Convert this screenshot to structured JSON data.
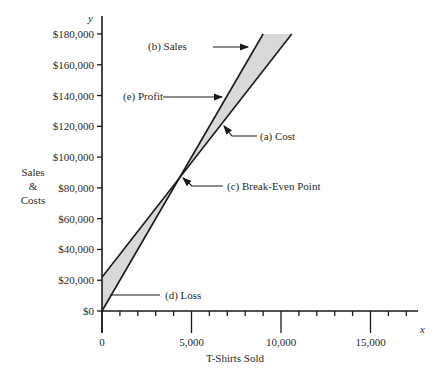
{
  "chart_data": {
    "type": "line",
    "title": "",
    "xlabel": "T-Shirts Sold",
    "ylabel": "Sales & Costs",
    "ylabel_lines": [
      "Sales",
      "&",
      "Costs"
    ],
    "x_axis_letter": "x",
    "y_axis_letter": "y",
    "xlim": [
      0,
      17500
    ],
    "ylim": [
      0,
      180000
    ],
    "x_ticks": [
      0,
      5000,
      10000,
      15000
    ],
    "x_tick_labels": [
      "0",
      "5,000",
      "10,000",
      "15,000"
    ],
    "x_minor_tick_step": 1000,
    "y_ticks": [
      0,
      20000,
      40000,
      60000,
      80000,
      100000,
      120000,
      140000,
      160000,
      180000
    ],
    "y_tick_labels": [
      "$0",
      "$20,000",
      "$40,000",
      "$60,000",
      "$80,000",
      "$100,000",
      "$120,000",
      "$140,000",
      "$160,000",
      "$180,000"
    ],
    "grid": false,
    "series": [
      {
        "name": "(a) Cost",
        "x": [
          0,
          10600
        ],
        "y": [
          22000,
          180000
        ]
      },
      {
        "name": "(b) Sales",
        "x": [
          0,
          9000
        ],
        "y": [
          0,
          180000
        ]
      }
    ],
    "shaded_regions": [
      {
        "name": "(d) Loss",
        "between": [
          "(a) Cost",
          "(b) Sales"
        ],
        "x_range": [
          0,
          4400
        ],
        "color": "#d9d9d9"
      },
      {
        "name": "(e) Profit",
        "between": [
          "(b) Sales",
          "(a) Cost"
        ],
        "x_range": [
          4400,
          10600
        ],
        "color": "#d9d9d9"
      }
    ],
    "annotations": [
      {
        "label": "(a) Cost",
        "target": "cost line",
        "point": [
          6800,
          129000
        ]
      },
      {
        "label": "(b) Sales",
        "target": "sales line",
        "point": [
          8400,
          168000
        ]
      },
      {
        "label": "(c) Break-Even Point",
        "target": "intersection",
        "point": [
          4400,
          88000
        ]
      },
      {
        "label": "(d) Loss",
        "target": "loss region",
        "point": [
          300,
          10000
        ]
      },
      {
        "label": "(e) Profit",
        "target": "profit region",
        "point": [
          7000,
          140000
        ]
      }
    ]
  }
}
